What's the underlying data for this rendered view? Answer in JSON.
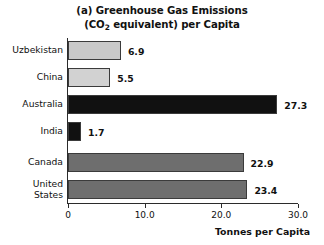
{
  "chart_data": {
    "type": "bar",
    "orientation": "horizontal",
    "title_line1": "(a) Greenhouse Gas Emissions",
    "title_line2_pre": "(CO",
    "title_line2_sub": "2",
    "title_line2_post": " equivalent) per Capita",
    "title": "(a) Greenhouse Gas Emissions (CO2 equivalent) per Capita",
    "categories": [
      "Uzbekistan",
      "China",
      "Australia",
      "India",
      "Canada",
      "United States"
    ],
    "values": [
      6.9,
      5.5,
      27.3,
      1.7,
      22.9,
      23.4
    ],
    "value_labels": [
      "6.9",
      "5.5",
      "27.3",
      "1.7",
      "22.9",
      "23.4"
    ],
    "bar_colors": [
      "#c9c9c9",
      "#d2d2d2",
      "#111111",
      "#111111",
      "#6e6e6e",
      "#6e6e6e"
    ],
    "xlabel": "Tonnes per Capita",
    "ylabel": "",
    "xlim": [
      0,
      30
    ],
    "xticks": [
      0,
      10,
      20,
      30
    ],
    "xtick_labels": [
      "0",
      "10.0",
      "20.0",
      "30.0"
    ],
    "grid": false,
    "legend": "none"
  }
}
